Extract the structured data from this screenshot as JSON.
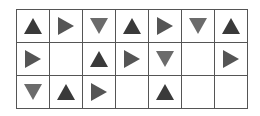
{
  "grid": {
    "rows": 3,
    "cols": 7,
    "colors": {
      "up": "#3a3a3a",
      "right": "#555555",
      "down": "#6b6b6b",
      "grid_line": "#555555"
    },
    "cells": [
      [
        "up",
        "right",
        "down",
        "up",
        "right",
        "down",
        "up"
      ],
      [
        "right",
        "",
        "up",
        "right",
        "down",
        "",
        "right"
      ],
      [
        "down",
        "up",
        "right",
        "",
        "up",
        "",
        ""
      ]
    ]
  }
}
